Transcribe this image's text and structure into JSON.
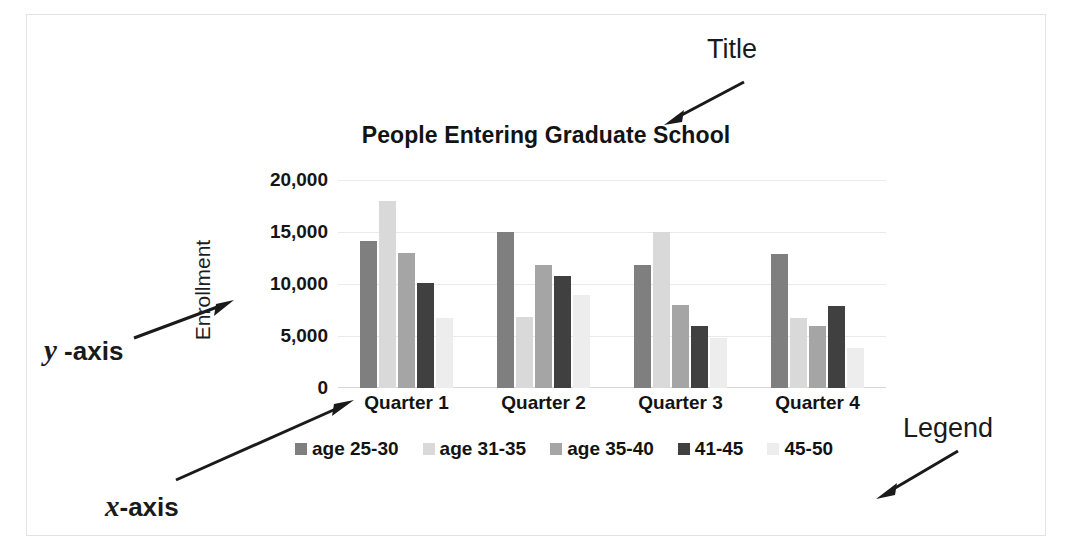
{
  "annotations": {
    "title_label": "Title",
    "legend_label": "Legend",
    "yaxis_label_italic": "y",
    "yaxis_label_rest": " -axis",
    "xaxis_label_italic": "x",
    "xaxis_label_rest": "-axis"
  },
  "chart_data": {
    "type": "bar",
    "title": "People Entering Graduate School",
    "xlabel": "",
    "ylabel": "Enrollment",
    "categories": [
      "Quarter 1",
      "Quarter 2",
      "Quarter 3",
      "Quarter 4"
    ],
    "ylim": [
      0,
      20000
    ],
    "yticks": [
      0,
      5000,
      10000,
      15000,
      20000
    ],
    "ytick_labels": [
      "0",
      "5,000",
      "10,000",
      "15,000",
      "20,000"
    ],
    "grid": true,
    "legend_position": "bottom",
    "series": [
      {
        "name": "age 25-30",
        "color": "#7f7f7f",
        "values": [
          14100,
          15000,
          11800,
          12900
        ]
      },
      {
        "name": "age 31-35",
        "color": "#d9d9d9",
        "values": [
          18000,
          6800,
          15000,
          6700
        ]
      },
      {
        "name": "age 35-40",
        "color": "#a5a5a5",
        "values": [
          13000,
          11800,
          8000,
          6000
        ]
      },
      {
        "name": "41-45",
        "color": "#404040",
        "values": [
          10100,
          10800,
          6000,
          7900
        ]
      },
      {
        "name": "45-50",
        "color": "#ededed",
        "values": [
          6700,
          8900,
          4800,
          3800
        ]
      }
    ]
  }
}
